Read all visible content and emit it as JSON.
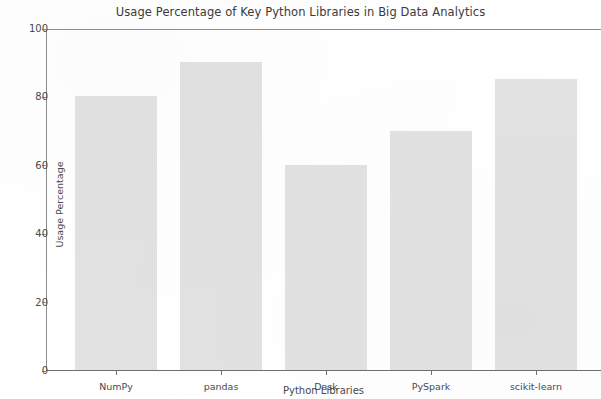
{
  "chart_data": {
    "type": "bar",
    "title": "Usage Percentage of Key Python Libraries in Big Data Analytics",
    "xlabel": "Python Libraries",
    "ylabel": "Usage Percentage",
    "categories": [
      "NumPy",
      "pandas",
      "Dask",
      "PySpark",
      "scikit-learn"
    ],
    "values": [
      80,
      90,
      60,
      70,
      85
    ],
    "series": [
      {
        "name": "Usage Percentage",
        "values": [
          80,
          90,
          60,
          70,
          85
        ]
      }
    ],
    "ylim": [
      0,
      100
    ],
    "yticks": [
      0,
      20,
      40,
      60,
      80,
      100
    ],
    "ytick_labels": [
      "0",
      "20",
      "40",
      "60",
      "80",
      "100"
    ],
    "grid": false,
    "legend": null,
    "legend_position": "none",
    "bar_color": "#e2e2e2",
    "axis_color": "#8d8d8d",
    "text_color": "#4a4a4a"
  }
}
